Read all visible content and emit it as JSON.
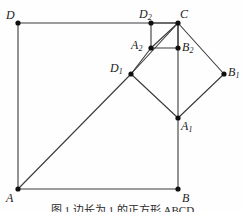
{
  "figure": {
    "type": "geometry-diagram",
    "width": 245,
    "height": 212,
    "background_color": "#fefefe",
    "line_color": "#3a3a3a",
    "vertex_color": "#101010",
    "line_width": 1.1,
    "vertex_radius": 2.6,
    "caption": "图 1   边长为 1 的正方形 ABCD",
    "points": [
      {
        "id": "D",
        "base": "D",
        "sub": "",
        "x": 18,
        "y": 23,
        "label_x": 6,
        "label_y": 9,
        "label_align": "left"
      },
      {
        "id": "D2",
        "base": "D",
        "sub": "2",
        "x": 151,
        "y": 23,
        "label_x": 139,
        "label_y": 8,
        "label_align": "left"
      },
      {
        "id": "C",
        "base": "C",
        "sub": "",
        "x": 178,
        "y": 23,
        "label_x": 180,
        "label_y": 8,
        "label_align": "left"
      },
      {
        "id": "A2",
        "base": "A",
        "sub": "2",
        "x": 151,
        "y": 48,
        "label_x": 131,
        "label_y": 39,
        "label_align": "left"
      },
      {
        "id": "B2",
        "base": "B",
        "sub": "2",
        "x": 178,
        "y": 48,
        "label_x": 182,
        "label_y": 41,
        "label_align": "left"
      },
      {
        "id": "D1",
        "base": "D",
        "sub": "1",
        "x": 131,
        "y": 74,
        "label_x": 110,
        "label_y": 62,
        "label_align": "left"
      },
      {
        "id": "B1",
        "base": "B",
        "sub": "1",
        "x": 224,
        "y": 74,
        "label_x": 228,
        "label_y": 66,
        "label_align": "left"
      },
      {
        "id": "A1",
        "base": "A",
        "sub": "1",
        "x": 178,
        "y": 118,
        "label_x": 181,
        "label_y": 120,
        "label_align": "left"
      },
      {
        "id": "A",
        "base": "A",
        "sub": "",
        "x": 18,
        "y": 189,
        "label_x": 6,
        "label_y": 192,
        "label_align": "left"
      },
      {
        "id": "B",
        "base": "B",
        "sub": "",
        "x": 178,
        "y": 189,
        "label_x": 182,
        "label_y": 192,
        "label_align": "left"
      }
    ],
    "segments": [
      {
        "name": "outer-square-top-DC",
        "from": "D",
        "to": "C"
      },
      {
        "name": "outer-square-left-DA",
        "from": "D",
        "to": "A"
      },
      {
        "name": "outer-square-bottom-AB",
        "from": "A",
        "to": "B"
      },
      {
        "name": "outer-square-right-BA1",
        "from": "B",
        "to": "A1"
      },
      {
        "name": "outer-square-right-A1C",
        "from": "A1",
        "to": "C"
      },
      {
        "name": "diamond-D1-C",
        "from": "D1",
        "to": "C"
      },
      {
        "name": "diamond-C-B1",
        "from": "C",
        "to": "B1"
      },
      {
        "name": "diamond-B1-A1",
        "from": "B1",
        "to": "A1"
      },
      {
        "name": "diamond-A1-D1",
        "from": "A1",
        "to": "D1"
      },
      {
        "name": "inner-square-D2-C",
        "from": "D2",
        "to": "C"
      },
      {
        "name": "inner-square-D2-A2",
        "from": "D2",
        "to": "A2"
      },
      {
        "name": "inner-square-A2-B2",
        "from": "A2",
        "to": "B2"
      },
      {
        "name": "inner-square-B2-C",
        "from": "B2",
        "to": "C"
      },
      {
        "name": "main-diagonal-A-D1",
        "from": "A",
        "to": "D1"
      },
      {
        "name": "main-diagonal-D1-A2",
        "from": "D1",
        "to": "A2"
      },
      {
        "name": "main-diagonal-A2-C",
        "from": "A2",
        "to": "C"
      }
    ]
  }
}
